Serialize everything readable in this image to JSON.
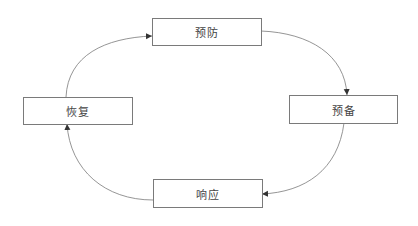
{
  "diagram": {
    "type": "cycle",
    "nodes": [
      {
        "id": "prevention",
        "label": "预防"
      },
      {
        "id": "preparedness",
        "label": "预备"
      },
      {
        "id": "response",
        "label": "响应"
      },
      {
        "id": "recovery",
        "label": "恢复"
      }
    ],
    "edges": [
      {
        "from": "预防",
        "to": "预备"
      },
      {
        "from": "预备",
        "to": "响应"
      },
      {
        "from": "响应",
        "to": "恢复"
      },
      {
        "from": "恢复",
        "to": "预防"
      }
    ],
    "colors": {
      "stroke": "#7a7a7a",
      "text": "#444444",
      "background": "#ffffff"
    }
  }
}
